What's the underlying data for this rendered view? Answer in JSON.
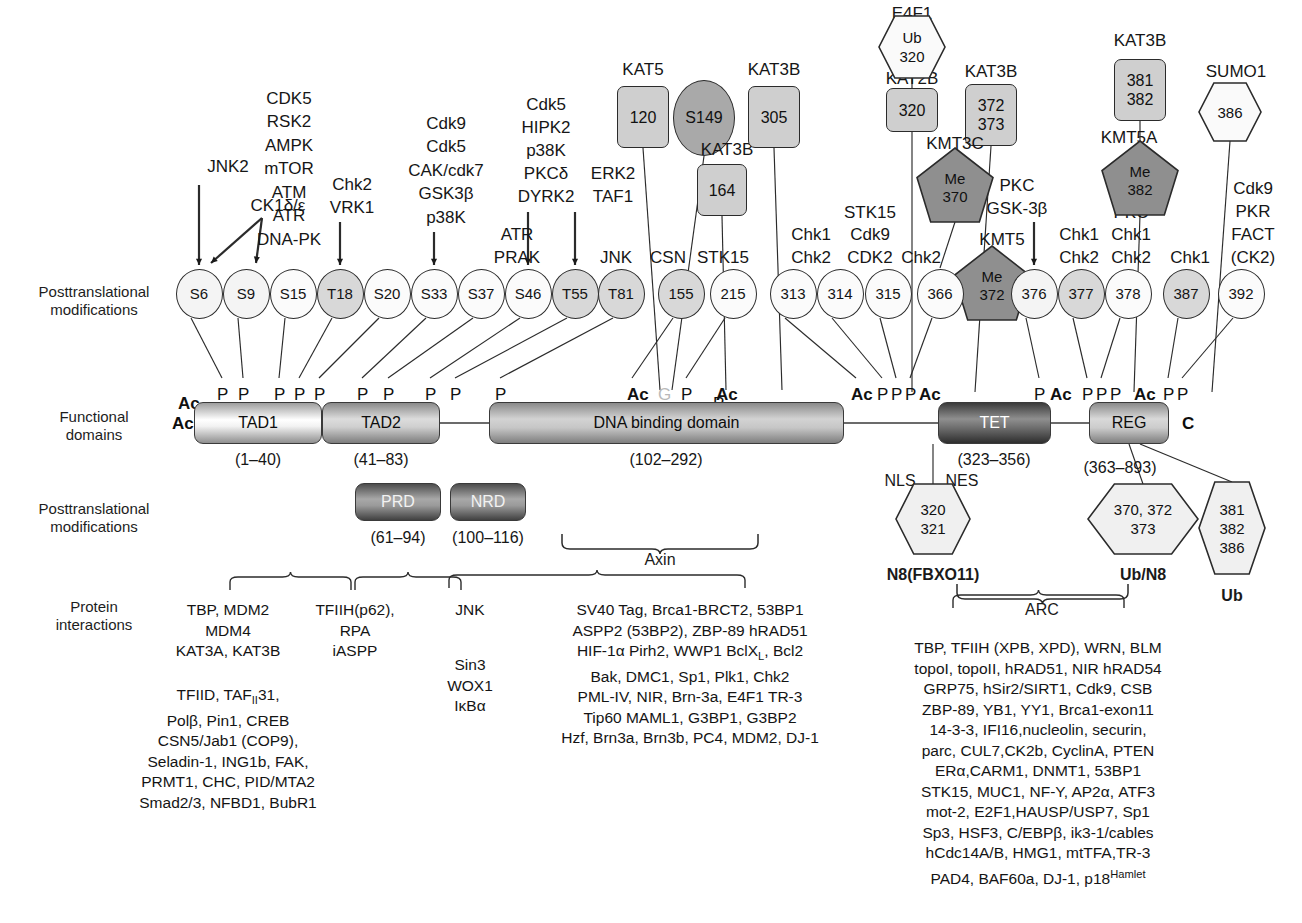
{
  "row_labels": {
    "ptm_top": "Posttranslational\nmodifications",
    "functional": "Functional\ndomains",
    "ptm_bottom": "Posttranslational\nmodifications",
    "interactions": "Protein\ninteractions"
  },
  "kinase_labels": [
    {
      "text": "JNK2",
      "x": 228,
      "y": 167
    },
    {
      "text": "CK1δ/ε",
      "x": 278,
      "y": 206
    },
    {
      "text": "CDK5",
      "x": 289,
      "y": 99
    },
    {
      "text": "RSK2",
      "x": 289,
      "y": 122
    },
    {
      "text": "AMPK",
      "x": 289,
      "y": 146
    },
    {
      "text": "mTOR",
      "x": 289,
      "y": 169
    },
    {
      "text": "ATM",
      "x": 289,
      "y": 193
    },
    {
      "text": "ATR",
      "x": 289,
      "y": 216
    },
    {
      "text": "DNA-PK",
      "x": 289,
      "y": 240
    },
    {
      "text": "Chk2",
      "x": 352,
      "y": 185
    },
    {
      "text": "VRK1",
      "x": 352,
      "y": 208
    },
    {
      "text": "Cdk9",
      "x": 446,
      "y": 124
    },
    {
      "text": "Cdk5",
      "x": 446,
      "y": 147
    },
    {
      "text": "CAK/cdk7",
      "x": 446,
      "y": 171
    },
    {
      "text": "GSK3β",
      "x": 446,
      "y": 194
    },
    {
      "text": "p38K",
      "x": 446,
      "y": 218
    },
    {
      "text": "ATR",
      "x": 517,
      "y": 235
    },
    {
      "text": "PRAK",
      "x": 517,
      "y": 258
    },
    {
      "text": "Cdk5",
      "x": 546,
      "y": 105
    },
    {
      "text": "HIPK2",
      "x": 546,
      "y": 128
    },
    {
      "text": "p38K",
      "x": 546,
      "y": 151
    },
    {
      "text": "PKCδ",
      "x": 546,
      "y": 174
    },
    {
      "text": "DYRK2",
      "x": 546,
      "y": 197
    },
    {
      "text": "ERK2",
      "x": 613,
      "y": 174
    },
    {
      "text": "TAF1",
      "x": 613,
      "y": 197
    },
    {
      "text": "JNK",
      "x": 616,
      "y": 258
    },
    {
      "text": "CSN",
      "x": 668,
      "y": 258
    },
    {
      "text": "STK15",
      "x": 723,
      "y": 258
    },
    {
      "text": "Chk1",
      "x": 811,
      "y": 235
    },
    {
      "text": "Chk2",
      "x": 811,
      "y": 258
    },
    {
      "text": "STK15",
      "x": 870,
      "y": 213
    },
    {
      "text": "Cdk9",
      "x": 870,
      "y": 235
    },
    {
      "text": "CDK2",
      "x": 870,
      "y": 258
    },
    {
      "text": "Chk2",
      "x": 921,
      "y": 258
    },
    {
      "text": "PKC",
      "x": 1017,
      "y": 186
    },
    {
      "text": "GSK-3β",
      "x": 1017,
      "y": 209
    },
    {
      "text": "Chk1",
      "x": 1079,
      "y": 235
    },
    {
      "text": "Chk2",
      "x": 1079,
      "y": 258
    },
    {
      "text": "PKC",
      "x": 1131,
      "y": 213
    },
    {
      "text": "Chk1",
      "x": 1131,
      "y": 235
    },
    {
      "text": "Chk2",
      "x": 1131,
      "y": 258
    },
    {
      "text": "Chk1",
      "x": 1190,
      "y": 258
    },
    {
      "text": "Cdk9",
      "x": 1253,
      "y": 189
    },
    {
      "text": "PKR",
      "x": 1253,
      "y": 212
    },
    {
      "text": "FACT",
      "x": 1253,
      "y": 235
    },
    {
      "text": "(CK2)",
      "x": 1253,
      "y": 258
    }
  ],
  "ptm_circles": [
    {
      "label": "S6",
      "cx": 199,
      "cy": 292,
      "shade": "light"
    },
    {
      "label": "S9",
      "cx": 246,
      "cy": 292,
      "shade": "light"
    },
    {
      "label": "S15",
      "cx": 293,
      "cy": 292,
      "shade": "plain"
    },
    {
      "label": "T18",
      "cx": 340,
      "cy": 292,
      "shade": "mid"
    },
    {
      "label": "S20",
      "cx": 387,
      "cy": 292,
      "shade": "plain"
    },
    {
      "label": "S33",
      "cx": 434,
      "cy": 292,
      "shade": "plain"
    },
    {
      "label": "S37",
      "cx": 481,
      "cy": 292,
      "shade": "plain"
    },
    {
      "label": "S46",
      "cx": 528,
      "cy": 292,
      "shade": "plain"
    },
    {
      "label": "T55",
      "cx": 575,
      "cy": 292,
      "shade": "mid"
    },
    {
      "label": "T81",
      "cx": 621,
      "cy": 292,
      "shade": "mid"
    },
    {
      "label": "155",
      "cx": 681,
      "cy": 292,
      "shade": "mid"
    },
    {
      "label": "215",
      "cx": 733,
      "cy": 292,
      "shade": "plain"
    },
    {
      "label": "313",
      "cx": 793,
      "cy": 292,
      "shade": "plain"
    },
    {
      "label": "314",
      "cx": 840,
      "cy": 292,
      "shade": "plain"
    },
    {
      "label": "315",
      "cx": 888,
      "cy": 292,
      "shade": "plain"
    },
    {
      "label": "366",
      "cx": 940,
      "cy": 292,
      "shade": "plain"
    },
    {
      "label": "376",
      "cx": 1034,
      "cy": 292,
      "shade": "light"
    },
    {
      "label": "377",
      "cx": 1081,
      "cy": 292,
      "shade": "mid"
    },
    {
      "label": "378",
      "cx": 1128,
      "cy": 292,
      "shade": "plain"
    },
    {
      "label": "387",
      "cx": 1186,
      "cy": 292,
      "shade": "mid"
    },
    {
      "label": "392",
      "cx": 1241,
      "cy": 292,
      "shade": "plain"
    }
  ],
  "top_shapes": [
    {
      "kind": "square",
      "lines": [
        "120"
      ],
      "cx": 643,
      "cy": 117,
      "w": 52,
      "h": 62,
      "title": "KAT5",
      "title_x": 643,
      "title_y": 70
    },
    {
      "kind": "oval",
      "lines": [
        "S149"
      ],
      "cx": 704,
      "cy": 118,
      "w": 62,
      "h": 76,
      "title": "",
      "title_x": 0,
      "title_y": 0
    },
    {
      "kind": "square",
      "lines": [
        "164"
      ],
      "cx": 722,
      "cy": 190,
      "w": 50,
      "h": 52,
      "title": "KAT3B",
      "title_x": 727,
      "title_y": 150
    },
    {
      "kind": "square",
      "lines": [
        "305"
      ],
      "cx": 774,
      "cy": 117,
      "w": 52,
      "h": 62,
      "title": "KAT3B",
      "title_x": 774,
      "title_y": 70
    },
    {
      "kind": "square",
      "lines": [
        "320"
      ],
      "cx": 912,
      "cy": 110,
      "w": 52,
      "h": 44,
      "title": "KAT2B",
      "title_x": 912,
      "title_y": 79
    },
    {
      "kind": "square",
      "lines": [
        "372",
        "373"
      ],
      "cx": 991,
      "cy": 115,
      "w": 52,
      "h": 62,
      "title": "KAT3B",
      "title_x": 991,
      "title_y": 72
    },
    {
      "kind": "square",
      "lines": [
        "381",
        "382"
      ],
      "cx": 1140,
      "cy": 90,
      "w": 52,
      "h": 62,
      "title": "KAT3B",
      "title_x": 1140,
      "title_y": 41
    }
  ],
  "top_hexes": [
    {
      "lines": [
        "Ub",
        "320"
      ],
      "cx": 912,
      "cy": 47,
      "w": 66,
      "h": 62,
      "title": "E4F1",
      "title_x": 912,
      "title_y": 14
    },
    {
      "lines": [
        "386"
      ],
      "cx": 1230,
      "cy": 112,
      "w": 62,
      "h": 58,
      "title": "SUMO1",
      "title_x": 1236,
      "title_y": 72
    }
  ],
  "pentagons": [
    {
      "lines": [
        "Me",
        "370"
      ],
      "cx": 955,
      "cy": 185,
      "w": 76,
      "h": 74,
      "title": "KMT3C",
      "title_x": 955,
      "title_y": 144
    },
    {
      "lines": [
        "Me",
        "372"
      ],
      "cx": 992,
      "cy": 283,
      "w": 76,
      "h": 74,
      "title": "KMT5",
      "title_x": 1002,
      "title_y": 240
    },
    {
      "lines": [
        "Me",
        "382"
      ],
      "cx": 1140,
      "cy": 178,
      "w": 76,
      "h": 74,
      "title": "KMT5A",
      "title_x": 1129,
      "title_y": 138
    }
  ],
  "ptm_marks": [
    {
      "t": "Ac",
      "x": 178,
      "y": 394,
      "bold": true
    },
    {
      "t": "P",
      "x": 217,
      "y": 385
    },
    {
      "t": "P",
      "x": 238,
      "y": 385
    },
    {
      "t": "P",
      "x": 274,
      "y": 385
    },
    {
      "t": "P",
      "x": 294,
      "y": 385
    },
    {
      "t": "P",
      "x": 314,
      "y": 385
    },
    {
      "t": "P",
      "x": 357,
      "y": 385
    },
    {
      "t": "P",
      "x": 383,
      "y": 385
    },
    {
      "t": "P",
      "x": 425,
      "y": 385
    },
    {
      "t": "P",
      "x": 450,
      "y": 385
    },
    {
      "t": "P",
      "x": 495,
      "y": 385
    },
    {
      "t": "Ac",
      "x": 627,
      "y": 385,
      "bold": true
    },
    {
      "t": "G",
      "x": 658,
      "y": 385,
      "gray": true
    },
    {
      "t": "P",
      "x": 681,
      "y": 385
    },
    {
      "t": "Ac",
      "x": 716,
      "y": 385,
      "bold": true
    },
    {
      "t": "P",
      "x": 713,
      "y": 394
    },
    {
      "t": "Ac",
      "x": 851,
      "y": 385,
      "bold": true
    },
    {
      "t": "P",
      "x": 877,
      "y": 385
    },
    {
      "t": "P",
      "x": 891,
      "y": 385
    },
    {
      "t": "P",
      "x": 905,
      "y": 385
    },
    {
      "t": "Ac",
      "x": 919,
      "y": 385,
      "bold": true
    },
    {
      "t": "P",
      "x": 1034,
      "y": 385
    },
    {
      "t": "Ac",
      "x": 1050,
      "y": 385,
      "bold": true
    },
    {
      "t": "P",
      "x": 1082,
      "y": 385
    },
    {
      "t": "P",
      "x": 1096,
      "y": 385
    },
    {
      "t": "P",
      "x": 1110,
      "y": 385
    },
    {
      "t": "Ac",
      "x": 1134,
      "y": 385,
      "bold": true
    },
    {
      "t": "P",
      "x": 1163,
      "y": 385
    },
    {
      "t": "P",
      "x": 1177,
      "y": 385
    }
  ],
  "mark_P": "P",
  "domains": [
    {
      "name": "TAD1",
      "x": 194,
      "y": 402,
      "w": 128,
      "h": 42,
      "cls": "d-tad1",
      "range": "(1–40)",
      "range_x": 258,
      "range_y": 460
    },
    {
      "name": "TAD2",
      "x": 322,
      "y": 402,
      "w": 118,
      "h": 42,
      "cls": "d-tad2",
      "range": "(41–83)",
      "range_x": 381,
      "range_y": 460
    },
    {
      "name": "DNA binding domain",
      "x": 489,
      "y": 402,
      "w": 355,
      "h": 42,
      "cls": "d-dbd",
      "range": "(102–292)",
      "range_x": 666,
      "range_y": 460
    },
    {
      "name": "TET",
      "x": 938,
      "y": 402,
      "w": 113,
      "h": 42,
      "cls": "d-tet",
      "range": "(323–356)",
      "range_x": 994,
      "range_y": 460
    },
    {
      "name": "REG",
      "x": 1089,
      "y": 402,
      "w": 80,
      "h": 42,
      "cls": "d-reg",
      "range": "(363–893)",
      "range_x": 1120,
      "range_y": 468
    }
  ],
  "sub_domains": [
    {
      "name": "PRD",
      "x": 355,
      "y": 483,
      "w": 86,
      "h": 38,
      "cls": "d-prd",
      "range": "(61–94)",
      "range_x": 398,
      "range_y": 538
    },
    {
      "name": "NRD",
      "x": 450,
      "y": 483,
      "w": 76,
      "h": 38,
      "cls": "d-nrd",
      "range": "(100–116)",
      "range_x": 488,
      "range_y": 538
    }
  ],
  "termini": {
    "n": "Ac",
    "n_x": 172,
    "n_y": 414,
    "c": "C",
    "c_x": 1182,
    "c_y": 414
  },
  "nls_nes": [
    {
      "t": "NLS",
      "x": 900,
      "y": 481
    },
    {
      "t": "NES",
      "x": 962,
      "y": 481
    }
  ],
  "bottom_hexes": [
    {
      "lines": [
        "320",
        "321"
      ],
      "cx": 933,
      "cy": 519,
      "w": 74,
      "h": 70,
      "caption": "N8(FBXO11)",
      "cap_x": 933,
      "cap_y": 575
    },
    {
      "lines": [
        "370, 372",
        "373"
      ],
      "cx": 1143,
      "cy": 519,
      "w": 110,
      "h": 70,
      "caption": "Ub/N8",
      "cap_x": 1143,
      "cap_y": 575
    },
    {
      "lines": [
        "381",
        "382",
        "386"
      ],
      "cx": 1232,
      "cy": 528,
      "w": 66,
      "h": 92,
      "caption": "Ub",
      "cap_x": 1232,
      "cap_y": 596
    }
  ],
  "braces": [
    {
      "label": "Axin",
      "x": 660,
      "y": 534,
      "w": 200,
      "label_y": 560
    },
    {
      "label": "ARC",
      "x": 1042,
      "y": 584,
      "w": 175,
      "label_y": 610
    }
  ],
  "interaction_blocks": [
    {
      "id": "tad1",
      "lines": [
        "TBP, MDM2",
        "MDM4",
        "KAT3A, KAT3B"
      ],
      "x": 228,
      "y": 600,
      "bold_index": -1
    },
    {
      "id": "tad2",
      "lines": [
        "TFIIH(p62),",
        "RPA",
        "iASPP"
      ],
      "x": 355,
      "y": 600,
      "bold_index": -1
    },
    {
      "id": "prd",
      "lines": [
        "TFIID, TAF<sub>II</sub>31,",
        "Polβ, Pin1, CREB",
        "CSN5/Jab1 (COP9),",
        "Seladin-1, ING1b, FAK,",
        "PRMT1, CHC, PID/MTA2",
        "Smad2/3, NFBD1, BubR1"
      ],
      "x": 228,
      "y": 685,
      "bold_index": -1
    },
    {
      "id": "jnk",
      "lines": [
        "JNK"
      ],
      "x": 470,
      "y": 600,
      "bold_index": -1
    },
    {
      "id": "nrd",
      "lines": [
        "Sin3",
        "WOX1",
        "IκBα"
      ],
      "x": 470,
      "y": 655,
      "bold_index": -1
    },
    {
      "id": "dbd",
      "lines": [
        "SV40 Tag, Brca1-BRCT2, 53BP1",
        "ASPP2 (53BP2), ZBP-89 hRAD51",
        "HIF-1α Pirh2, WWP1 BclX<sub>L</sub>, Bcl2",
        "Bak, DMC1, Sp1, Plk1, Chk2",
        "PML-IV, NIR, Brn-3a, E4F1 TR-3",
        "Tip60 MAML1, G3BP1, G3BP2",
        "Hzf, Brn3a, Brn3b, PC4, MDM2, DJ-1"
      ],
      "x": 690,
      "y": 600,
      "bold_index": -1
    },
    {
      "id": "arc",
      "lines": [
        "TBP, TFIIH (XPB, XPD), WRN, BLM",
        "topoI, topoII, hRAD51, NIR hRAD54",
        "GRP75, hSir2/SIRT1, Cdk9, CSB",
        "ZBP-89, YB1, YY1, Brca1-exon11",
        "14-3-3, IFI16,nucleolin, securin,",
        "parc, CUL7,CK2b, CyclinA, PTEN",
        "ERα,CARM1, DNMT1, 53BP1",
        "STK15, MUC1, NF-Y, AP2α, ATF3",
        "mot-2, E2F1,HAUSP/USP7, Sp1",
        "Sp3, HSF3, C/EBPβ, ik3-1/cables",
        "hCdc14A/B, HMG1, mtTFA,TR-3",
        "PAD4, BAF60a, DJ-1, p18<sup>Hamlet</sup>"
      ],
      "x": 1038,
      "y": 638,
      "bold_index": -1
    }
  ],
  "colors": {
    "ink": "#1a1a1a",
    "line": "#2b2b2b",
    "fill_light": "#f4f4f4",
    "fill_mid": "#d8d8d8",
    "fill_dark": "#a9a9a9",
    "pent_fill": "#8f8f8f",
    "gray_text": "#b9b9b9"
  }
}
